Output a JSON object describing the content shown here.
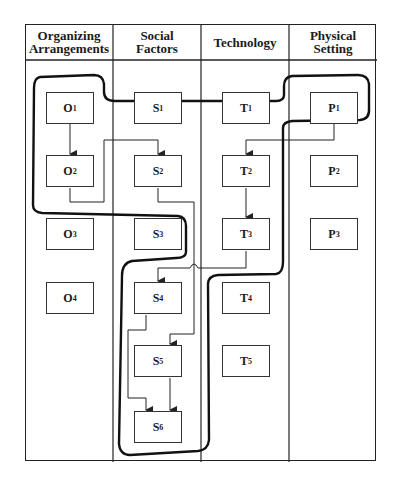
{
  "columns": [
    {
      "title": "Organizing Arrangements",
      "line1": "Organizing",
      "line2": "Arrangements"
    },
    {
      "title": "Social Factors",
      "line1": "Social",
      "line2": "Factors"
    },
    {
      "title": "Technology",
      "line1": "Technology",
      "line2": ""
    },
    {
      "title": "Physical Setting",
      "line1": "Physical",
      "line2": "Setting"
    }
  ],
  "nodes": {
    "O1": {
      "letter": "O",
      "sub": "1"
    },
    "O2": {
      "letter": "O",
      "sub": "2"
    },
    "O3": {
      "letter": "O",
      "sub": "3"
    },
    "O4": {
      "letter": "O",
      "sub": "4"
    },
    "S1": {
      "letter": "S",
      "sub": "1"
    },
    "S2": {
      "letter": "S",
      "sub": "2"
    },
    "S3": {
      "letter": "S",
      "sub": "3"
    },
    "S4": {
      "letter": "S",
      "sub": "4"
    },
    "S5": {
      "letter": "S",
      "sub": "5"
    },
    "S6": {
      "letter": "S",
      "sub": "6"
    },
    "T1": {
      "letter": "T",
      "sub": "1"
    },
    "T2": {
      "letter": "T",
      "sub": "2"
    },
    "T3": {
      "letter": "T",
      "sub": "3"
    },
    "T4": {
      "letter": "T",
      "sub": "4"
    },
    "T5": {
      "letter": "T",
      "sub": "5"
    },
    "P1": {
      "letter": "P",
      "sub": "1"
    },
    "P2": {
      "letter": "P",
      "sub": "2"
    },
    "P3": {
      "letter": "P",
      "sub": "3"
    }
  },
  "edges": [
    [
      "O1",
      "O2"
    ],
    [
      "O2",
      "S2"
    ],
    [
      "S2",
      "S5"
    ],
    [
      "P1",
      "T2"
    ],
    [
      "T2",
      "T3"
    ],
    [
      "T3",
      "S4"
    ],
    [
      "S4",
      "S6"
    ],
    [
      "S5",
      "S6"
    ]
  ],
  "colors": {
    "line": "#222222",
    "outline": "#111111",
    "background": "#ffffff"
  }
}
